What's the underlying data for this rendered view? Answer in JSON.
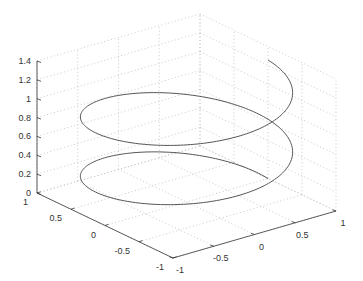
{
  "chart_data": {
    "type": "line3d",
    "title": "",
    "xlabel": "",
    "ylabel": "",
    "zlabel": "",
    "grid": true,
    "view": "default 3-D (azimuth -37.5, elevation 30)",
    "xlim": [
      -1,
      1
    ],
    "ylim": [
      -1,
      1
    ],
    "zlim": [
      0,
      1.4
    ],
    "x_ticks": [
      "-1",
      "-0.5",
      "0",
      "0.5",
      "1"
    ],
    "y_ticks": [
      "1",
      "0.5",
      "0",
      "-0.5",
      "-1"
    ],
    "z_ticks": [
      "0",
      "0.2",
      "0.4",
      "0.6",
      "0.8",
      "1",
      "1.2",
      "1.4"
    ],
    "series": [
      {
        "name": "helix",
        "description": "x = cos(t), y = sin(t), z = t/10, t from 0 to 4*pi (two full turns)",
        "t_start": 0,
        "t_end": 12.566,
        "z_scale": 0.1,
        "color": "#555555"
      }
    ]
  },
  "colors": {
    "axis": "#333333",
    "grid": "#bdbdbd",
    "line": "#555555",
    "background": "#ffffff"
  }
}
